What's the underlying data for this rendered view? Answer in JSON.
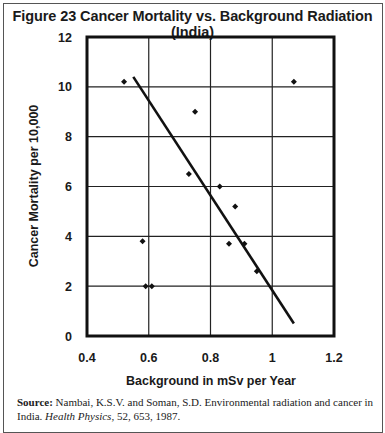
{
  "figure": {
    "title": "Figure 23  Cancer Mortality vs. Background Radiation (India)",
    "source_label": "Source:",
    "source_text_1": " Nambai, K.S.V. and Soman, S.D. Environmental radiation and cancer in India. ",
    "source_journal": "Health Physics",
    "source_text_2": ", 52, 653, 1987."
  },
  "chart_data": {
    "type": "scatter",
    "title": "Figure 23  Cancer Mortality vs. Background Radiation (India)",
    "xlabel": "Background in mSv per Year",
    "ylabel": "Cancer Mortality per 10,000",
    "xlim": [
      0.4,
      1.2
    ],
    "ylim": [
      0,
      12
    ],
    "xticks": [
      0.4,
      0.6,
      0.8,
      1,
      1.2
    ],
    "xtick_labels": [
      "0.4",
      "0.6",
      "0.8",
      "1",
      "1.2"
    ],
    "yticks": [
      0,
      2,
      4,
      6,
      8,
      10,
      12
    ],
    "ytick_labels": [
      "0",
      "2",
      "4",
      "6",
      "8",
      "10",
      "12"
    ],
    "grid": true,
    "legend": null,
    "points": [
      {
        "x": 0.52,
        "y": 10.2
      },
      {
        "x": 0.58,
        "y": 3.8
      },
      {
        "x": 0.59,
        "y": 2.0
      },
      {
        "x": 0.61,
        "y": 2.0
      },
      {
        "x": 0.73,
        "y": 6.5
      },
      {
        "x": 0.75,
        "y": 9.0
      },
      {
        "x": 0.83,
        "y": 6.0
      },
      {
        "x": 0.86,
        "y": 3.7
      },
      {
        "x": 0.88,
        "y": 5.2
      },
      {
        "x": 0.91,
        "y": 3.7
      },
      {
        "x": 0.95,
        "y": 2.6
      },
      {
        "x": 1.07,
        "y": 10.2
      }
    ],
    "trend_line": {
      "x1": 0.55,
      "y1": 10.4,
      "x2": 1.07,
      "y2": 0.5
    }
  }
}
